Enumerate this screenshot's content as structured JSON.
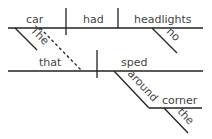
{
  "diagram": {
    "type": "sentence-diagram",
    "style": "Reed-Kellogg",
    "main_clause": {
      "subject": "car",
      "verb": "had",
      "direct_object": "headlights",
      "subject_modifier": "The",
      "object_modifier": "no"
    },
    "relative_clause": {
      "subject": "that",
      "verb": "sped",
      "preposition": "around",
      "prepositional_object": "corner",
      "object_modifier": "the",
      "connector": "dashed line from car to that"
    },
    "colors": {
      "line": "#222222",
      "text": "#444444",
      "background": "#ffffff"
    }
  }
}
